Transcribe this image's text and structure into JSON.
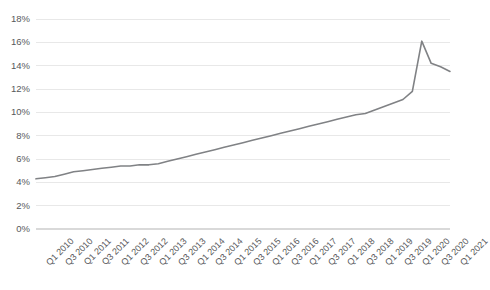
{
  "chart_data": {
    "type": "line",
    "title": "",
    "subtitle": "",
    "xlabel": "",
    "ylabel": "",
    "ylim": [
      0,
      18
    ],
    "ytick_values": [
      0,
      2,
      4,
      6,
      8,
      10,
      12,
      14,
      16,
      18
    ],
    "ytick_labels": [
      "0%",
      "2%",
      "4%",
      "6%",
      "8%",
      "10%",
      "12%",
      "14%",
      "16%",
      "18%"
    ],
    "grid": true,
    "grid_axis": "y",
    "legend": false,
    "legend_position": "none",
    "line_color": "#808285",
    "grid_color": "#e8e8e8",
    "axis_text_color": "#58595b",
    "background_color": "#ffffff",
    "x": [
      "Q1 2010",
      "Q2 2010",
      "Q3 2010",
      "Q4 2010",
      "Q1 2011",
      "Q2 2011",
      "Q3 2011",
      "Q4 2011",
      "Q1 2012",
      "Q2 2012",
      "Q3 2012",
      "Q4 2012",
      "Q1 2013",
      "Q2 2013",
      "Q3 2013",
      "Q4 2013",
      "Q1 2014",
      "Q2 2014",
      "Q3 2014",
      "Q4 2014",
      "Q1 2015",
      "Q2 2015",
      "Q3 2015",
      "Q4 2015",
      "Q1 2016",
      "Q2 2016",
      "Q3 2016",
      "Q4 2016",
      "Q1 2017",
      "Q2 2017",
      "Q3 2017",
      "Q4 2017",
      "Q1 2018",
      "Q2 2018",
      "Q3 2018",
      "Q4 2018",
      "Q1 2019",
      "Q2 2019",
      "Q3 2019",
      "Q4 2019",
      "Q1 2020",
      "Q2 2020",
      "Q3 2020",
      "Q4 2020",
      "Q1 2021"
    ],
    "xtick_labels": [
      "Q1 2010",
      "Q3 2010",
      "Q1 2011",
      "Q3 2011",
      "Q1 2012",
      "Q3 2012",
      "Q1 2013",
      "Q3 2013",
      "Q1 2014",
      "Q3 2014",
      "Q1 2015",
      "Q3 2015",
      "Q1 2016",
      "Q3 2016",
      "Q1 2017",
      "Q3 2017",
      "Q1 2018",
      "Q3 2018",
      "Q1 2019",
      "Q3 2019",
      "Q1 2020",
      "Q3 2020",
      "Q1 2021"
    ],
    "xtick_indices": [
      0,
      2,
      4,
      6,
      8,
      10,
      12,
      14,
      16,
      18,
      20,
      22,
      24,
      26,
      28,
      30,
      32,
      34,
      36,
      38,
      40,
      42,
      44
    ],
    "values": [
      4.3,
      4.4,
      4.5,
      4.7,
      4.9,
      5.0,
      5.1,
      5.2,
      5.3,
      5.4,
      5.4,
      5.5,
      5.5,
      5.6,
      5.8,
      6.0,
      6.2,
      6.4,
      6.6,
      6.8,
      7.0,
      7.2,
      7.4,
      7.6,
      7.8,
      8.0,
      8.2,
      8.4,
      8.6,
      8.8,
      9.0,
      9.2,
      9.4,
      9.6,
      9.8,
      9.9,
      10.2,
      10.5,
      10.8,
      11.1,
      11.8,
      16.1,
      14.2,
      13.9,
      13.5
    ],
    "series": [
      {
        "name": "Series 1",
        "color": "#808285",
        "values": [
          4.3,
          4.4,
          4.5,
          4.7,
          4.9,
          5.0,
          5.1,
          5.2,
          5.3,
          5.4,
          5.4,
          5.5,
          5.5,
          5.6,
          5.8,
          6.0,
          6.2,
          6.4,
          6.6,
          6.8,
          7.0,
          7.2,
          7.4,
          7.6,
          7.8,
          8.0,
          8.2,
          8.4,
          8.6,
          8.8,
          9.0,
          9.2,
          9.4,
          9.6,
          9.8,
          9.9,
          10.2,
          10.5,
          10.8,
          11.1,
          11.8,
          16.1,
          14.2,
          13.9,
          13.5
        ]
      }
    ],
    "annotations": []
  }
}
